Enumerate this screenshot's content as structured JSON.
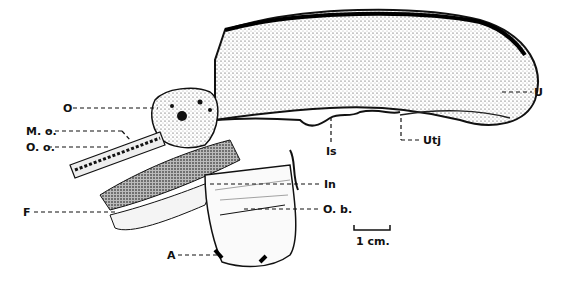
{
  "figure": {
    "type": "anatomical illustration",
    "labels": {
      "O": "O",
      "Mo": "M. o.",
      "Oo": "O. o.",
      "F": "F",
      "A": "A",
      "In": "In",
      "Ob": "O. b.",
      "Is": "Is",
      "Utj": "Utj",
      "U": "U"
    },
    "scale_bar": {
      "label": "1 cm."
    }
  }
}
